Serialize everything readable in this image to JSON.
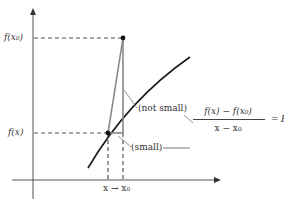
{
  "diagram": {
    "axes": {
      "y_label_top": "f(x₀)",
      "y_label_bottom": "f(x)",
      "x_label": "x → x₀"
    },
    "annotations": {
      "not_small": "(not small)",
      "small": "(small)"
    },
    "formula": {
      "numerator": "f(x) − f(x₀)",
      "denominator": "x − x₀",
      "equals": "=",
      "result": "R(x)"
    },
    "colors": {
      "curve": "#1a1a1a",
      "axes": "#555555",
      "dashed": "#555555",
      "secant": "#888888",
      "points": "#111111"
    }
  }
}
